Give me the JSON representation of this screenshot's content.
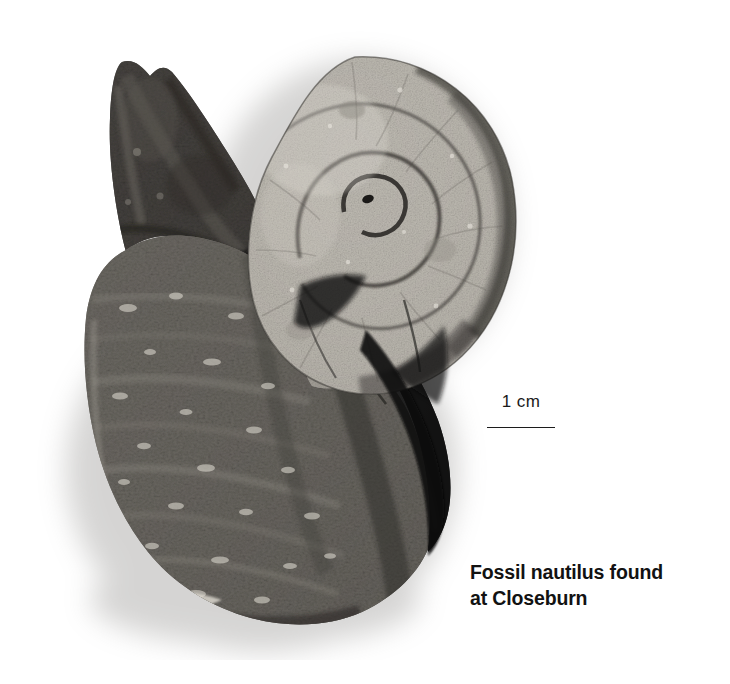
{
  "page": {
    "background_color": "#ffffff",
    "width": 730,
    "height": 684
  },
  "specimen": {
    "name": "fossil-nautilus-specimen",
    "description_parts": {
      "spiral_shell": "coiled nautilus shell, light granular sandstone",
      "matrix_rock": "dark grey angular rock matrix",
      "shadow": "soft grey drop shadow"
    },
    "colors": {
      "shell_light": "#c9c6bf",
      "shell_mid": "#a9a59d",
      "shell_dark_rim": "#2e2c29",
      "matrix_dark": "#3c3a38",
      "matrix_mid": "#6a6763",
      "matrix_light": "#8e8b85",
      "deep_shadow": "#0a0a0a",
      "drop_shadow": "#b9b7b4"
    }
  },
  "scale_bar": {
    "label": "1 cm",
    "line_color": "#1c1c1c",
    "length_px": 68
  },
  "caption": {
    "line1": "Fossil nautilus found",
    "line2": "at Closeburn",
    "color": "#121212"
  }
}
